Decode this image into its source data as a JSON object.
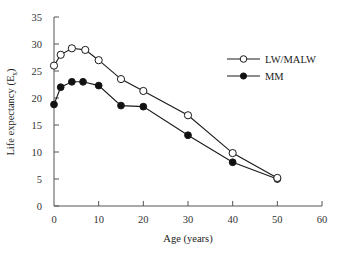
{
  "chart_data": {
    "type": "line",
    "title": "",
    "xlabel": "Age (years)",
    "ylabel": "Life expectancy (E",
    "ylabel_subscript": "x",
    "ylabel_suffix": ")",
    "xlim": [
      0,
      60
    ],
    "ylim": [
      0,
      35
    ],
    "xticks": [
      0,
      10,
      20,
      30,
      40,
      50,
      60
    ],
    "yticks": [
      0,
      5,
      10,
      15,
      20,
      25,
      30,
      35
    ],
    "grid": false,
    "legend_position": "upper right",
    "series": [
      {
        "name": "LW/MALW",
        "marker": "open-circle",
        "x": [
          0,
          1.5,
          4,
          7,
          10,
          15,
          20,
          30,
          40,
          50
        ],
        "values": [
          26,
          28,
          29.2,
          28.9,
          27,
          23.5,
          21.3,
          16.8,
          9.8,
          5.2
        ]
      },
      {
        "name": "MM",
        "marker": "filled-circle",
        "x": [
          0,
          1.5,
          4,
          6.5,
          10,
          15,
          20,
          30,
          40,
          50
        ],
        "values": [
          18.8,
          22,
          23,
          23,
          22.3,
          18.6,
          18.4,
          13.1,
          8.1,
          5.0
        ]
      }
    ]
  },
  "colors": {
    "axis": "#555555",
    "line": "#1a1a1a",
    "marker_fill_open": "#ffffff",
    "marker_fill_filled": "#111111"
  }
}
